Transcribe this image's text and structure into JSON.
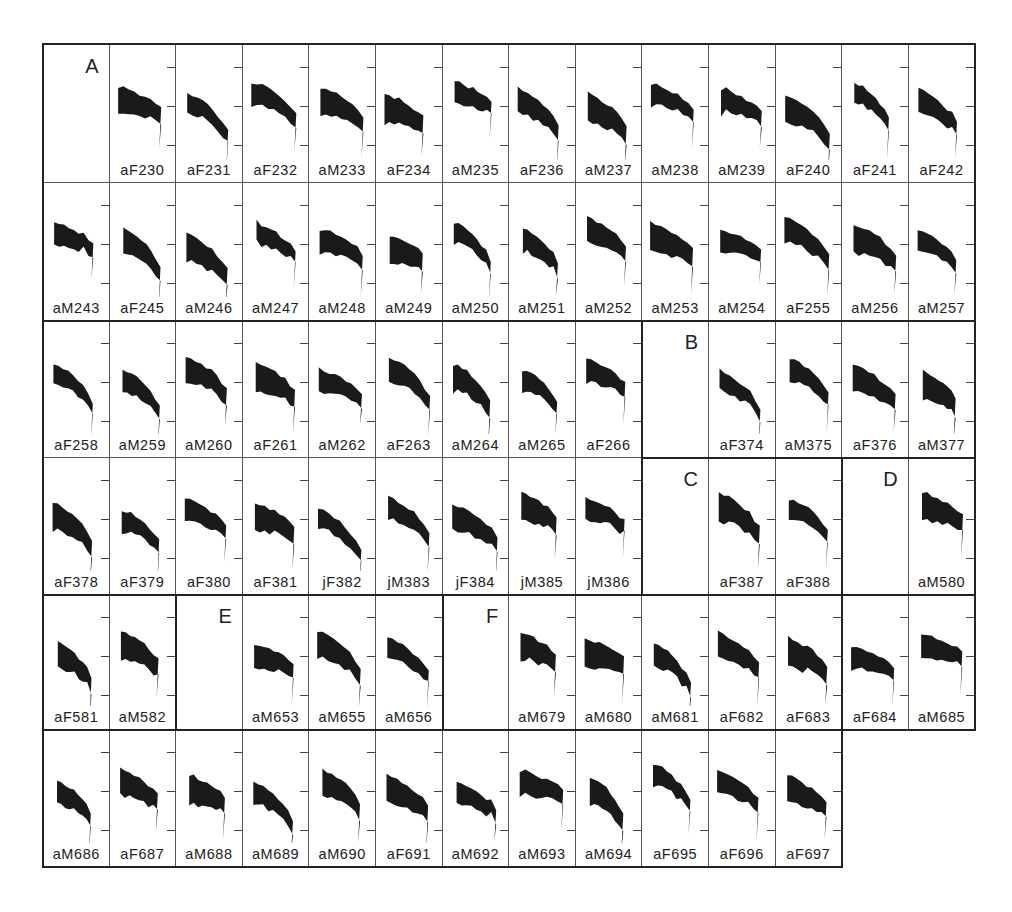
{
  "figure": {
    "columns": 14,
    "rows": 6,
    "cell_width_px": 66.6,
    "row_heights_px": [
      139,
      138,
      137,
      137,
      135,
      137
    ],
    "ink_color": "#1a1a1a",
    "border_color": "#222222",
    "groups": [
      {
        "label": "A",
        "label_cell": [
          0,
          0
        ]
      },
      {
        "label": "B",
        "label_cell": [
          2,
          9
        ]
      },
      {
        "label": "C",
        "label_cell": [
          3,
          9
        ]
      },
      {
        "label": "D",
        "label_cell": [
          3,
          12
        ]
      },
      {
        "label": "E",
        "label_cell": [
          4,
          2
        ]
      },
      {
        "label": "F",
        "label_cell": [
          4,
          6
        ]
      }
    ],
    "rows_data": [
      [
        "",
        "aF230",
        "aF231",
        "aF232",
        "aM233",
        "aF234",
        "aM235",
        "aF236",
        "aM237",
        "aM238",
        "aM239",
        "aF240",
        "aF241",
        "aF242"
      ],
      [
        "aM243",
        "aF245",
        "aM246",
        "aM247",
        "aM248",
        "aM249",
        "aM250",
        "aM251",
        "aM252",
        "aM253",
        "aM254",
        "aF255",
        "aM256",
        "aM257"
      ],
      [
        "aF258",
        "aM259",
        "aM260",
        "aF261",
        "aM262",
        "aF263",
        "aM264",
        "aM265",
        "aF266",
        "",
        "aF374",
        "aM375",
        "aF376",
        "aM377"
      ],
      [
        "aF378",
        "aF379",
        "aF380",
        "aF381",
        "jF382",
        "jM383",
        "jF384",
        "jM385",
        "jM386",
        "",
        "aF387",
        "aF388",
        "",
        "aM580"
      ],
      [
        "aF581",
        "aM582",
        "",
        "aM653",
        "aM655",
        "aM656",
        "",
        "aM679",
        "aM680",
        "aM681",
        "aF682",
        "aF683",
        "aF684",
        "aM685"
      ],
      [
        "aM686",
        "aF687",
        "aM688",
        "aM689",
        "aM690",
        "aF691",
        "aM692",
        "aM693",
        "aM694",
        "aF695",
        "aF696",
        "aF697"
      ]
    ]
  }
}
